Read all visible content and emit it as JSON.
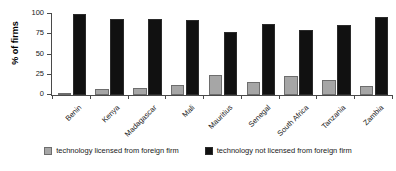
{
  "chart_data": {
    "type": "bar",
    "title": "",
    "xlabel": "",
    "ylabel": "% of firms",
    "ylim": [
      0,
      100
    ],
    "yticks": [
      0,
      25,
      50,
      75,
      100
    ],
    "grid": false,
    "legend_position": "bottom",
    "categories": [
      "Benin",
      "Kenya",
      "Madagascar",
      "Mali",
      "Mauritius",
      "Senegal",
      "South Africa",
      "Tanzania",
      "Zambia"
    ],
    "series": [
      {
        "name": "technology licensed from foreign firm",
        "color": "#a6a6a6",
        "values": [
          2,
          8,
          9,
          12,
          25,
          16,
          24,
          18,
          11
        ]
      },
      {
        "name": "technology not licensed from foreign firm",
        "color": "#111111",
        "values": [
          100,
          94,
          94,
          92,
          78,
          88,
          80,
          87,
          96
        ]
      }
    ]
  },
  "legend": {
    "items": [
      {
        "label": "technology licensed from foreign firm",
        "swatch": "licensed"
      },
      {
        "label": "technology not licensed from foreign firm",
        "swatch": "notlicensed"
      }
    ]
  }
}
